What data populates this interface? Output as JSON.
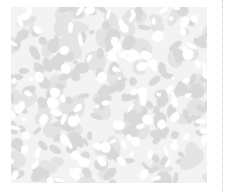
{
  "tile": {
    "kind": "mottled gray-and-white texture thumbnail",
    "colors": {
      "background": "#ffffff",
      "base": "#f3f3f3",
      "dark_patch": "#d9d9d9",
      "mid_patch": "#e4e4e4",
      "light_patch": "#ffffff",
      "divider": "#c8c8c8"
    },
    "bounds": {
      "x": 11,
      "y": 7,
      "width": 196,
      "height": 176
    }
  },
  "divider": {
    "style": "dotted",
    "x": 222
  }
}
